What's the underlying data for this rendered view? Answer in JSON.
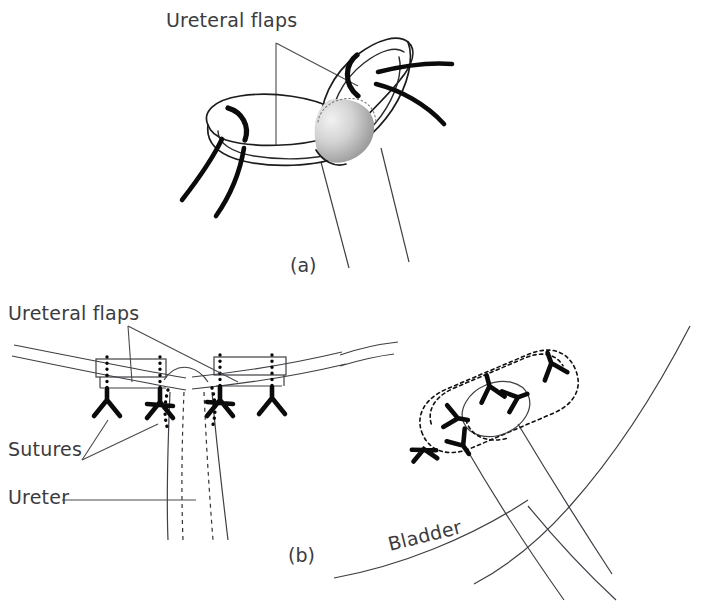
{
  "figure": {
    "background_color": "#ffffff",
    "ink_color": "#1c1c1c",
    "label_color": "#3b3b3f",
    "lumen_shade_color": "#9a9a9a"
  },
  "panels": [
    {
      "id": "a",
      "caption": "(a)",
      "caption_x": 290,
      "caption_y": 272,
      "description": "Two spatulated ureteral ends with flaps held by stay sutures; shaded lumen visible"
    },
    {
      "id": "b",
      "caption": "(b)",
      "caption_x": 288,
      "caption_y": 562,
      "description": "Completed anastomosis of ureteral flaps to bladder with interrupted sutures"
    }
  ],
  "labels": [
    {
      "name": "ureteral-flaps-top",
      "text": "Ureteral flaps",
      "x": 166,
      "y": 27,
      "rotation": 0,
      "anchor": "start"
    },
    {
      "name": "ureteral-flaps-bottom",
      "text": "Ureteral flaps",
      "x": 8,
      "y": 320,
      "rotation": 0,
      "anchor": "start"
    },
    {
      "name": "sutures",
      "text": "Sutures",
      "x": 8,
      "y": 456,
      "rotation": 0,
      "anchor": "start"
    },
    {
      "name": "ureter",
      "text": "Ureter",
      "x": 8,
      "y": 504,
      "rotation": 0,
      "anchor": "start"
    },
    {
      "name": "bladder",
      "text": "Bladder",
      "x": 390,
      "y": 551,
      "rotation": -14,
      "anchor": "start"
    }
  ],
  "callouts": {
    "panel_a_flaps": 2,
    "panel_b_flaps": 2,
    "panel_b_sutures": 2
  },
  "counts": {
    "panel_a_suture_loops": 2,
    "panel_a_thread_tails": 4,
    "panel_b_left_knots": 4,
    "panel_b_right_knots": 6,
    "panel_b_stitch_columns": 4
  }
}
